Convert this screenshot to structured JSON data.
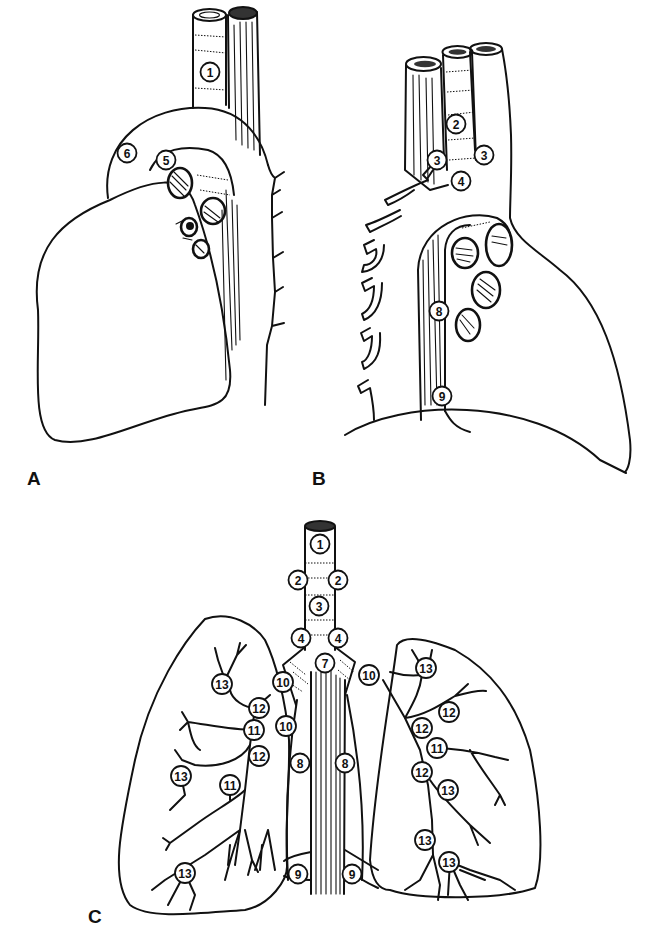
{
  "figure": {
    "background": "#ffffff",
    "ink": "#111111",
    "panels": [
      {
        "id": "A",
        "letter": "A",
        "description": "Lateral view (right side): lung, trachea, esophagus, azygos arch",
        "labels": [
          {
            "n": "1",
            "x": 210,
            "y": 72
          },
          {
            "n": "6",
            "x": 127,
            "y": 153
          },
          {
            "n": "5",
            "x": 166,
            "y": 160
          }
        ]
      },
      {
        "id": "B",
        "letter": "B",
        "description": "Lateral view (left side): aortic arch, esophagus, trachea, left lung hilum",
        "labels": [
          {
            "n": "2",
            "x": 456,
            "y": 124
          },
          {
            "n": "3",
            "x": 437,
            "y": 160
          },
          {
            "n": "3",
            "x": 484,
            "y": 155
          },
          {
            "n": "4",
            "x": 461,
            "y": 181
          },
          {
            "n": "8",
            "x": 439,
            "y": 311
          },
          {
            "n": "9",
            "x": 442,
            "y": 396
          }
        ]
      },
      {
        "id": "C",
        "letter": "C",
        "description": "Frontal view: trachea, carina, main bronchi and both lungs with nodal stations",
        "labels": [
          {
            "n": "1",
            "x": 320,
            "y": 544
          },
          {
            "n": "2",
            "x": 298,
            "y": 580
          },
          {
            "n": "2",
            "x": 338,
            "y": 580
          },
          {
            "n": "3",
            "x": 319,
            "y": 606
          },
          {
            "n": "4",
            "x": 301,
            "y": 638
          },
          {
            "n": "4",
            "x": 338,
            "y": 638
          },
          {
            "n": "7",
            "x": 325,
            "y": 663
          },
          {
            "n": "10",
            "x": 283,
            "y": 682
          },
          {
            "n": "10",
            "x": 369,
            "y": 675
          },
          {
            "n": "13",
            "x": 222,
            "y": 684
          },
          {
            "n": "12",
            "x": 259,
            "y": 708
          },
          {
            "n": "11",
            "x": 254,
            "y": 730
          },
          {
            "n": "10",
            "x": 286,
            "y": 726
          },
          {
            "n": "12",
            "x": 259,
            "y": 756
          },
          {
            "n": "8",
            "x": 300,
            "y": 763
          },
          {
            "n": "8",
            "x": 345,
            "y": 763
          },
          {
            "n": "13",
            "x": 181,
            "y": 776
          },
          {
            "n": "11",
            "x": 230,
            "y": 785
          },
          {
            "n": "13",
            "x": 426,
            "y": 668
          },
          {
            "n": "12",
            "x": 449,
            "y": 712
          },
          {
            "n": "12",
            "x": 422,
            "y": 728
          },
          {
            "n": "11",
            "x": 437,
            "y": 748
          },
          {
            "n": "12",
            "x": 422,
            "y": 772
          },
          {
            "n": "13",
            "x": 448,
            "y": 790
          },
          {
            "n": "13",
            "x": 425,
            "y": 840
          },
          {
            "n": "13",
            "x": 449,
            "y": 862
          },
          {
            "n": "13",
            "x": 185,
            "y": 873
          },
          {
            "n": "9",
            "x": 298,
            "y": 874
          },
          {
            "n": "9",
            "x": 352,
            "y": 874
          }
        ]
      }
    ],
    "panel_letter_positions": {
      "A": {
        "x": 27,
        "y": 468
      },
      "B": {
        "x": 312,
        "y": 468
      },
      "C": {
        "x": 88,
        "y": 906
      }
    }
  }
}
